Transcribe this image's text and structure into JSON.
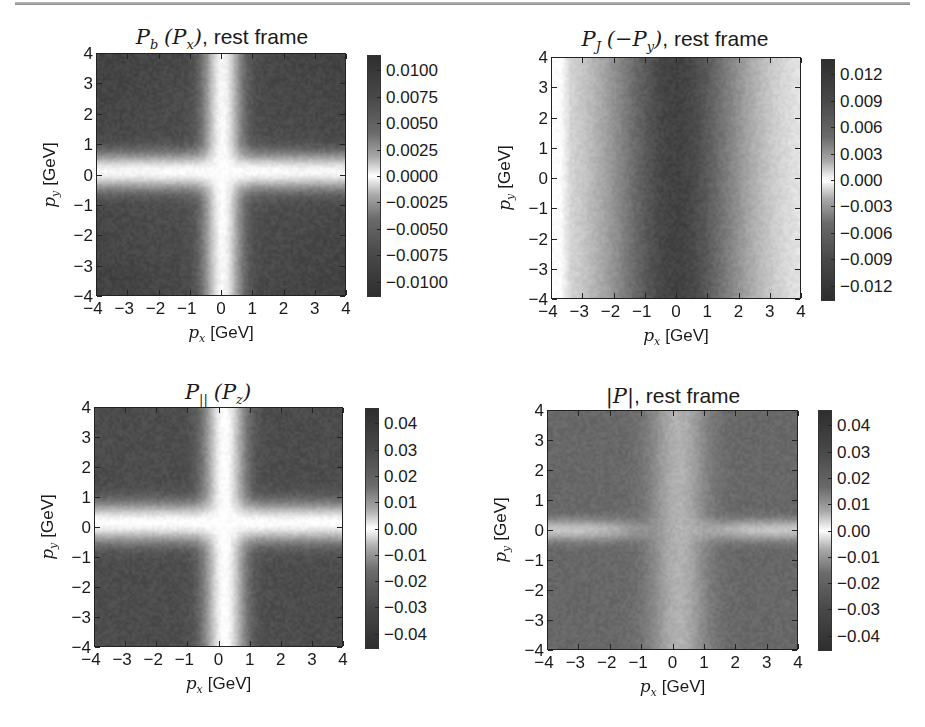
{
  "figure": {
    "panels": [
      {
        "id": "pb",
        "title_math": "P_b (P_x)",
        "title_text": ", rest frame",
        "title_display": "Pₙ (Pₓ)",
        "xlabel_var": "pₓ",
        "xlabel_unit": " [GeV]",
        "ylabel_var": "pᵧ",
        "ylabel_unit": " [GeV]"
      },
      {
        "id": "pj",
        "title_math": "P_J (−P_y)",
        "title_text": ", rest frame",
        "xlabel_var": "pₓ",
        "xlabel_unit": " [GeV]",
        "ylabel_var": "pᵧ",
        "ylabel_unit": " [GeV]"
      },
      {
        "id": "ppar",
        "title_math": "P_|| (P_z)",
        "title_text": "",
        "xlabel_var": "pₓ",
        "xlabel_unit": " [GeV]",
        "ylabel_var": "pᵧ",
        "ylabel_unit": " [GeV]"
      },
      {
        "id": "pabs",
        "title_math": "|P|",
        "title_text": ", rest frame",
        "xlabel_var": "pₓ",
        "xlabel_unit": " [GeV]",
        "ylabel_var": "pᵧ",
        "ylabel_unit": " [GeV]"
      }
    ],
    "titles": {
      "pb": {
        "main": "P",
        "sub": "b",
        "paren_main": "P",
        "paren_sub": "x",
        "prefix": "",
        "suffix": ", rest frame"
      },
      "pj": {
        "main": "P",
        "sub": "J",
        "paren_main": "−P",
        "paren_sub": "y",
        "prefix": "",
        "suffix": ", rest frame"
      },
      "ppar": {
        "main": "P",
        "sub": "||",
        "paren_main": "P",
        "paren_sub": "z",
        "prefix": "",
        "suffix": ""
      },
      "pabs": {
        "text_math": "|P|",
        "suffix": ", rest frame"
      }
    },
    "axis": {
      "xlabel_var": "p",
      "xlabel_sub": "x",
      "xlabel_unit": "[GeV]",
      "ylabel_var": "p",
      "ylabel_sub": "y",
      "ylabel_unit": "[GeV]",
      "ticks": [
        "−4",
        "−3",
        "−2",
        "−1",
        "0",
        "1",
        "2",
        "3",
        "4"
      ]
    },
    "colorbars": {
      "pb": [
        "0.0100",
        "0.0075",
        "0.0050",
        "0.0025",
        "0.0000",
        "−0.0025",
        "−0.0050",
        "−0.0075",
        "−0.0100"
      ],
      "pj": [
        "0.012",
        "0.009",
        "0.006",
        "0.003",
        "0.000",
        "−0.003",
        "−0.006",
        "−0.009",
        "−0.012"
      ],
      "ppar": [
        "0.04",
        "0.03",
        "0.02",
        "0.01",
        "0.00",
        "−0.01",
        "−0.02",
        "−0.03",
        "−0.04"
      ],
      "pabs": [
        "0.04",
        "0.03",
        "0.02",
        "0.01",
        "0.00",
        "−0.01",
        "−0.02",
        "−0.03",
        "−0.04"
      ]
    }
  },
  "chart_data": [
    {
      "type": "heatmap",
      "title": "P_b (P_x), rest frame",
      "xlabel": "p_x [GeV]",
      "ylabel": "p_y [GeV]",
      "xlim": [
        -4,
        4
      ],
      "ylim": [
        -4,
        4
      ],
      "xticks": [
        -4,
        -3,
        -2,
        -1,
        0,
        1,
        2,
        3,
        4
      ],
      "yticks": [
        -4,
        -3,
        -2,
        -1,
        0,
        1,
        2,
        3,
        4
      ],
      "colorbar": {
        "ticks": [
          0.01,
          0.0075,
          0.005,
          0.0025,
          0.0,
          -0.0025,
          -0.005,
          -0.0075,
          -0.01
        ],
        "range": [
          -0.011,
          0.011
        ],
        "colormap": "grayscale, dark at extremes, white at zero"
      },
      "description": "White cross along p_x≈0 and p_y≈0 (|value|≈0); dark quadrants with |value|≈0.008–0.011; darkest near corners"
    },
    {
      "type": "heatmap",
      "title": "P_J (−P_y), rest frame",
      "xlabel": "p_x [GeV]",
      "ylabel": "p_y [GeV]",
      "xlim": [
        -4,
        4
      ],
      "ylim": [
        -4,
        4
      ],
      "xticks": [
        -4,
        -3,
        -2,
        -1,
        0,
        1,
        2,
        3,
        4
      ],
      "yticks": [
        -4,
        -3,
        -2,
        -1,
        0,
        1,
        2,
        3,
        4
      ],
      "colorbar": {
        "ticks": [
          0.012,
          0.009,
          0.006,
          0.003,
          0.0,
          -0.003,
          -0.006,
          -0.009,
          -0.012
        ],
        "range": [
          -0.013,
          0.013
        ],
        "colormap": "grayscale, dark at extremes, white at zero"
      },
      "description": "Vertical bands: darkest (|value|≈0.011) around p_x≈0, fading to light near p_x=±4; almost no p_y dependence"
    },
    {
      "type": "heatmap",
      "title": "P_|| (P_z)",
      "xlabel": "p_x [GeV]",
      "ylabel": "p_y [GeV]",
      "xlim": [
        -4,
        4
      ],
      "ylim": [
        -4,
        4
      ],
      "xticks": [
        -4,
        -3,
        -2,
        -1,
        0,
        1,
        2,
        3,
        4
      ],
      "yticks": [
        -4,
        -3,
        -2,
        -1,
        0,
        1,
        2,
        3,
        4
      ],
      "colorbar": {
        "ticks": [
          0.04,
          0.03,
          0.02,
          0.01,
          0.0,
          -0.01,
          -0.02,
          -0.03,
          -0.04
        ],
        "range": [
          -0.043,
          0.043
        ],
        "colormap": "grayscale, dark at extremes, white at zero"
      },
      "description": "White cross along p_x≈0.2 and p_y≈0.2; dark quadrants |value|≈0.03–0.04"
    },
    {
      "type": "heatmap",
      "title": "|P|, rest frame",
      "xlabel": "p_x [GeV]",
      "ylabel": "p_y [GeV]",
      "xlim": [
        -4,
        4
      ],
      "ylim": [
        -4,
        4
      ],
      "xticks": [
        -4,
        -3,
        -2,
        -1,
        0,
        1,
        2,
        3,
        4
      ],
      "yticks": [
        -4,
        -3,
        -2,
        -1,
        0,
        1,
        2,
        3,
        4
      ],
      "colorbar": {
        "ticks": [
          0.04,
          0.03,
          0.02,
          0.01,
          0.0,
          -0.01,
          -0.02,
          -0.03,
          -0.04
        ],
        "range": [
          -0.043,
          0.043
        ],
        "colormap": "grayscale, dark at extremes, white at zero"
      },
      "description": "Light horizontal band at p_y≈0 for |p_x|>1.5; medium-gray vertical band near p_x≈0; dark quadrants |value|≈0.035"
    }
  ]
}
